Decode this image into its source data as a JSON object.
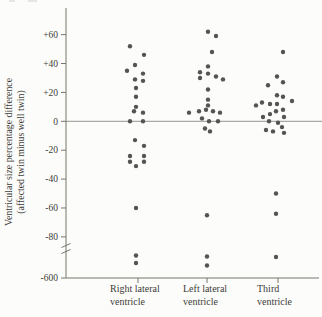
{
  "figure": {
    "background": "#fcfcfa",
    "dot_color": "#555452",
    "axis_color": "#77766f",
    "zero_line_color": "#8a897f",
    "text_color": "#3d3c38"
  },
  "chart_data": {
    "type": "scatter",
    "title": "",
    "ylabel_lines": [
      "Ventricular size percentage difference",
      "(affected twin minus well twin)"
    ],
    "xlabel": "",
    "y_ticks": [
      {
        "label": "+60",
        "value": 60
      },
      {
        "label": "+40",
        "value": 40
      },
      {
        "label": "+20",
        "value": 20
      },
      {
        "label": "0",
        "value": 0
      },
      {
        "label": "-20",
        "value": -20
      },
      {
        "label": "-40",
        "value": -40
      },
      {
        "label": "-60",
        "value": -60
      },
      {
        "label": "-80",
        "value": -80
      },
      {
        "label": "-600",
        "value": -600
      }
    ],
    "axis_break": {
      "between": [
        -80,
        -600
      ]
    },
    "zero_line": true,
    "grid": false,
    "legend": false,
    "categories": [
      {
        "label_lines": [
          "Right lateral",
          "ventricle"
        ]
      },
      {
        "label_lines": [
          "Left lateral",
          "ventricle"
        ]
      },
      {
        "label_lines": [
          "Third",
          "ventricle"
        ]
      }
    ],
    "series": [
      {
        "name": "Right lateral ventricle",
        "points": [
          [
            -6,
            52
          ],
          [
            8,
            46
          ],
          [
            -1,
            39
          ],
          [
            -9,
            35
          ],
          [
            7,
            33
          ],
          [
            -1,
            29
          ],
          [
            7,
            28
          ],
          [
            0,
            23
          ],
          [
            0,
            17
          ],
          [
            0,
            10
          ],
          [
            -2,
            7
          ],
          [
            7,
            6
          ],
          [
            -6,
            0
          ],
          [
            7,
            0
          ],
          [
            -1,
            -13
          ],
          [
            8,
            -17
          ],
          [
            -6,
            -24
          ],
          [
            8,
            -24
          ],
          [
            -6,
            -28
          ],
          [
            8,
            -28
          ],
          [
            0,
            -31
          ],
          [
            0,
            -60
          ],
          [
            0,
            -150
          ],
          [
            0,
            -300
          ]
        ]
      },
      {
        "name": "Left lateral ventricle",
        "points": [
          [
            1,
            62
          ],
          [
            9,
            59
          ],
          [
            5,
            48
          ],
          [
            1,
            38
          ],
          [
            -7,
            34
          ],
          [
            1,
            33
          ],
          [
            9,
            31
          ],
          [
            -7,
            30
          ],
          [
            16,
            29
          ],
          [
            1,
            22
          ],
          [
            1,
            15
          ],
          [
            1,
            11
          ],
          [
            -1,
            8
          ],
          [
            -8,
            7
          ],
          [
            6,
            7
          ],
          [
            13,
            6
          ],
          [
            -18,
            6
          ],
          [
            -5,
            2
          ],
          [
            2,
            0
          ],
          [
            11,
            0
          ],
          [
            -2,
            -5
          ],
          [
            3,
            -7
          ],
          [
            0,
            -65
          ],
          [
            0,
            -170
          ],
          [
            0,
            -350
          ]
        ]
      },
      {
        "name": "Third ventricle",
        "points": [
          [
            7,
            48
          ],
          [
            1,
            31
          ],
          [
            7,
            27
          ],
          [
            -8,
            25
          ],
          [
            1,
            18
          ],
          [
            7,
            17
          ],
          [
            16,
            14
          ],
          [
            -14,
            13
          ],
          [
            -6,
            12
          ],
          [
            1,
            12
          ],
          [
            -20,
            11
          ],
          [
            7,
            8
          ],
          [
            0,
            7
          ],
          [
            -6,
            5
          ],
          [
            -13,
            3
          ],
          [
            8,
            3
          ],
          [
            -7,
            0
          ],
          [
            2,
            -1
          ],
          [
            6,
            -4
          ],
          [
            -10,
            -6
          ],
          [
            -3,
            -7
          ],
          [
            8,
            -8
          ],
          [
            0,
            -50
          ],
          [
            0,
            -64
          ],
          [
            0,
            -180
          ]
        ]
      }
    ]
  }
}
